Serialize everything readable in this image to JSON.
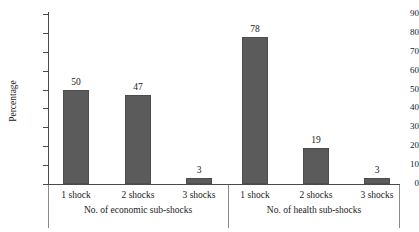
{
  "chart_data": {
    "type": "bar",
    "title": "",
    "subtitle": "",
    "xlabel": "",
    "ylabel": "Percentage",
    "ylim": [
      0,
      90
    ],
    "ytick_step": 10,
    "yticks": [
      0,
      10,
      20,
      30,
      40,
      50,
      60,
      70,
      80,
      90
    ],
    "grid": false,
    "legend": false,
    "bar_color": "#5b5b5b",
    "axis_color": "#4a4a4a",
    "groups": [
      {
        "group_label": "No. of economic sub-shocks",
        "categories": [
          "1 shock",
          "2 shocks",
          "3 shocks"
        ],
        "values": [
          50,
          47,
          3
        ]
      },
      {
        "group_label": "No. of health sub-shocks",
        "categories": [
          "1 shock",
          "2 shocks",
          "3 shocks"
        ],
        "values": [
          78,
          19,
          3
        ]
      }
    ],
    "categories": [
      "1 shock",
      "2 shocks",
      "3 shocks",
      "1 shock",
      "2 shocks",
      "3 shocks"
    ],
    "values": [
      50,
      47,
      3,
      78,
      19,
      3
    ],
    "value_labels": [
      "50",
      "47",
      "3",
      "78",
      "19",
      "3"
    ]
  }
}
